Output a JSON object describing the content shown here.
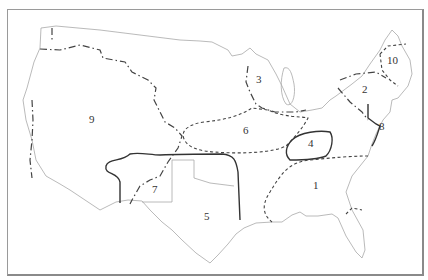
{
  "map": {
    "title": "",
    "regions": [
      {
        "id": "1",
        "label": "1"
      },
      {
        "id": "2",
        "label": "2"
      },
      {
        "id": "3",
        "label": "3"
      },
      {
        "id": "4",
        "label": "4"
      },
      {
        "id": "5",
        "label": "5"
      },
      {
        "id": "6",
        "label": "6"
      },
      {
        "id": "7",
        "label": "7"
      },
      {
        "id": "8",
        "label": "8"
      },
      {
        "id": "9",
        "label": "9"
      },
      {
        "id": "10",
        "label": "10"
      }
    ],
    "colors": {
      "outline": "#a8a8a8",
      "boundary": "#333333",
      "frame": "#9a9a9a"
    }
  }
}
